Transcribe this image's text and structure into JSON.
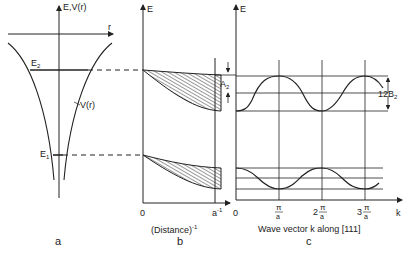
{
  "panel_a": {
    "axis_label": "E,V(r)",
    "r_label": "r",
    "potential_label": "V(r)",
    "level_upper": "E",
    "level_upper_sub": "2",
    "level_lower": "E",
    "level_lower_sub": "1",
    "caption": "a"
  },
  "panel_b": {
    "axis_label": "E",
    "x_origin": "0",
    "x_end": "a",
    "x_end_sup": "-1",
    "xlabel": "(Distance)",
    "xlabel_sup": "-1",
    "width_label": "A",
    "width_label_sub": "2",
    "caption": "b"
  },
  "panel_c": {
    "axis_label": "E",
    "x_origin": "0",
    "ticks": [
      {
        "prefix": "",
        "num": "π",
        "den": "a"
      },
      {
        "prefix": "2",
        "num": "π",
        "den": "a"
      },
      {
        "prefix": "3",
        "num": "π",
        "den": "a"
      }
    ],
    "k_label": "k",
    "xlabel": "Wave vector k along [111]",
    "bandwidth_label": "12B",
    "bandwidth_sub": "2",
    "caption": "c"
  },
  "colors": {
    "line": "#222222",
    "background": "#ffffff"
  }
}
